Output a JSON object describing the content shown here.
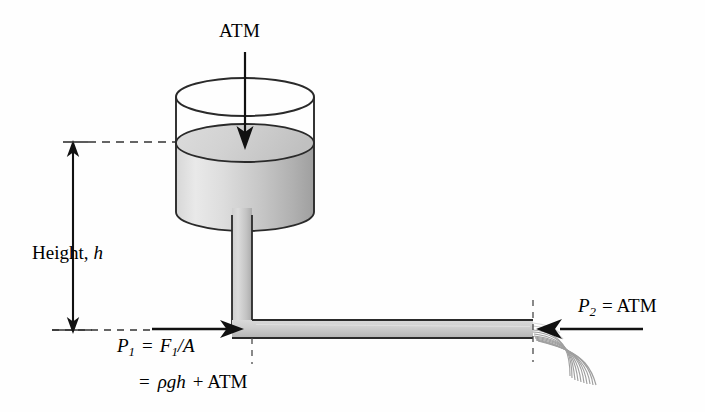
{
  "figure": {
    "background_color": "#fefefe",
    "line_color": "#1a1a1a",
    "fluid_light": "#e6e6e6",
    "fluid_mid": "#cfcfcf",
    "fluid_dark": "#a8a8a8",
    "spray_color": "#9a9a9a"
  },
  "labels": {
    "atm_top": "ATM",
    "height": "Height,",
    "height_var": "h",
    "p2": {
      "symbol": "P",
      "sub": "2",
      "equals": "= ATM"
    },
    "p1_line1": {
      "symbol": "P",
      "sub": "1",
      "equals": "=",
      "numerator": "F",
      "num_sub": "1",
      "slash": "/A"
    },
    "p1_line2": {
      "equals": "=",
      "rho": "ρ",
      "g": "g",
      "h": "h",
      "plus_atm": "+ ATM"
    }
  },
  "elements": {
    "container_name": "open-cylinder-vessel",
    "liquid_name": "liquid-fill",
    "vertical_pipe_name": "vertical-pipe",
    "horizontal_pipe_name": "horizontal-pipe",
    "spray_name": "water-spray",
    "atm_arrow_name": "atm-down-arrow",
    "height_arrow_name": "height-double-arrow",
    "p1_arrow_name": "p1-force-arrow",
    "p2_arrow_name": "p2-force-arrow",
    "top_dashed_name": "top-reference-dashed-line",
    "bottom_dashed_name": "bottom-reference-dashed-line",
    "outlet_dashed_name": "outlet-vertical-dashed-line",
    "elbow_dashed_name": "elbow-vertical-dashed-line"
  },
  "geometry": {
    "cylinder_left": 176,
    "cylinder_right": 314,
    "cylinder_top_y": 97,
    "cylinder_bottom_y": 212,
    "liquid_surface_y": 143,
    "pipe_x_left": 232,
    "pipe_x_right": 252,
    "horizontal_pipe_top": 320,
    "horizontal_pipe_bottom": 338,
    "outlet_x": 533,
    "height_arrow_x": 73,
    "height_top_y": 142,
    "height_bottom_y": 330
  }
}
